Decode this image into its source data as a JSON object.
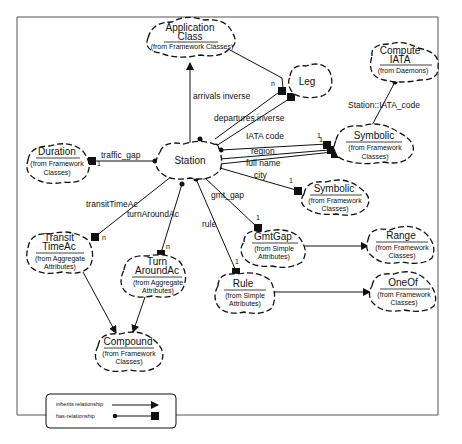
{
  "diagram": {
    "type": "UML class diagram (Booch cloud notation)",
    "nodes": {
      "application_class": {
        "title1": "Application",
        "title2": "Class",
        "sub1": "(from Framework Classes)"
      },
      "leg": {
        "title1": "Leg"
      },
      "compute_iata": {
        "title1": "Compute",
        "title2": "IATA",
        "sub1": "(from Daemons)"
      },
      "duration": {
        "title1": "Duration",
        "sub1": "(from Framework",
        "sub2": "Classes)"
      },
      "station": {
        "title1": "Station"
      },
      "symbolic_a": {
        "title1": "Symbolic",
        "sub1": "(from Framework",
        "sub2": "Classes)"
      },
      "symbolic_b": {
        "title1": "Symbolic",
        "sub1": "(from Framework",
        "sub2": "Classes)"
      },
      "transit_timeac": {
        "title1": "Transit",
        "title2": "TimeAc",
        "sub1": "(from Aggregate",
        "sub2": "Attributes)"
      },
      "turn_aroundac": {
        "title1": "Turn",
        "title2": "AroundAc",
        "sub1": "(from Aggregate",
        "sub2": "Attributes)"
      },
      "gmtgap": {
        "title1": "GmtGap",
        "sub1": "(from Simple",
        "sub2": "Attributes)"
      },
      "range": {
        "title1": "Range",
        "sub1": "(from Framework",
        "sub2": "Classes)"
      },
      "rule": {
        "title1": "Rule",
        "sub1": "(from Simple",
        "sub2": "Attributes)"
      },
      "oneof": {
        "title1": "OneOf",
        "sub1": "(from Framework",
        "sub2": "Classes)"
      },
      "compound": {
        "title1": "Compound",
        "sub1": "(from Framework",
        "sub2": "Classes)"
      }
    },
    "edges": {
      "arrivals_inverse": "arrivals inverse",
      "departures_inverse": "departures inverse",
      "traffic_gap": "traffic_gap",
      "iata_code": "IATA code",
      "region": "region",
      "full_name": "full name",
      "city": "city",
      "gmt_gap": "gmt_gap",
      "rule": "rule",
      "transit_timeac": "transitTimeAc",
      "turn_aroundac": "turnAroundAc",
      "station_iata_code": "Station::IATA_code"
    },
    "multiplicities": {
      "leg_n": "n",
      "traffic_1": "1",
      "iata_1a": "1",
      "iata_1b": "1",
      "city_1": "1",
      "gmtgap_1": "1",
      "rule_1": "1",
      "transit_n": "n",
      "turn_n": "n"
    },
    "legend": {
      "inherits": "inherits relationship",
      "has": "has-relationship"
    }
  }
}
